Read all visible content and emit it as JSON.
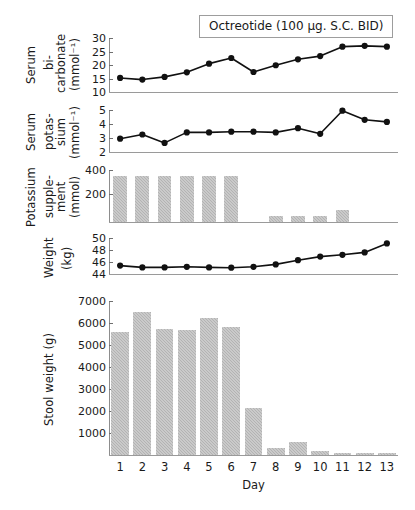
{
  "annotation": {
    "treatment_label": "Octreotide (100 µg. S.C. BID)"
  },
  "axis": {
    "x_title": "Day",
    "days": [
      "1",
      "2",
      "3",
      "4",
      "5",
      "6",
      "7",
      "8",
      "9",
      "10",
      "11",
      "12",
      "13"
    ]
  },
  "panels": {
    "bicarbonate": {
      "label_lines": [
        "Serum",
        "bi-\ncarbonate",
        "(mmol⁻¹)"
      ],
      "ticks": [
        "30",
        "25",
        "20",
        "15",
        "10"
      ]
    },
    "potassium": {
      "label_lines": [
        "Serum",
        "potas-\nsium",
        "(mmol⁻¹)"
      ],
      "ticks": [
        "5",
        "4",
        "3",
        "2"
      ]
    },
    "supplement": {
      "label_lines": [
        "Potassium",
        "supple-\nment",
        "(mmol)"
      ],
      "ticks": [
        "400",
        "200"
      ]
    },
    "weight": {
      "label_lines": [
        "Weight",
        "(kg)"
      ],
      "ticks": [
        "50",
        "48",
        "46",
        "44"
      ]
    },
    "stool": {
      "label": "Stool weight (g)",
      "ticks": [
        "7000",
        "6000",
        "5000",
        "4000",
        "3000",
        "2000",
        "1000"
      ]
    }
  },
  "colors": {
    "bar_fill": "#b3b3b3",
    "line": "#111111",
    "marker": "#111111",
    "axis": "#8d8d8d"
  },
  "chart_data": [
    {
      "type": "line",
      "title": "Serum bicarbonate",
      "xlabel": "Day",
      "ylabel": "Serum bi-carbonate (mmol⁻¹)",
      "x": [
        1,
        2,
        3,
        4,
        5,
        6,
        7,
        8,
        9,
        10,
        11,
        12,
        13
      ],
      "values": [
        15.2,
        14.6,
        15.6,
        17.3,
        20.5,
        22.6,
        17.4,
        19.9,
        22.1,
        23.3,
        26.8,
        27.1,
        26.8
      ],
      "ylim": [
        10,
        30
      ],
      "yticks": [
        10,
        15,
        20,
        25,
        30
      ],
      "grid": false,
      "annotation": "Octreotide (100 µg. S.C. BID)"
    },
    {
      "type": "line",
      "title": "Serum potassium",
      "xlabel": "Day",
      "ylabel": "Serum potassium (mmol⁻¹)",
      "x": [
        1,
        2,
        3,
        4,
        5,
        6,
        7,
        8,
        9,
        10,
        11,
        12,
        13
      ],
      "values": [
        2.95,
        3.25,
        2.65,
        3.4,
        3.4,
        3.45,
        3.45,
        3.4,
        3.7,
        3.3,
        4.95,
        4.3,
        4.15
      ],
      "ylim": [
        2,
        5
      ],
      "yticks": [
        2,
        3,
        4,
        5
      ],
      "grid": false
    },
    {
      "type": "bar",
      "title": "Potassium supplement",
      "xlabel": "Day",
      "ylabel": "Potassium supplement (mmol)",
      "categories": [
        "1",
        "2",
        "3",
        "4",
        "5",
        "6",
        "7",
        "8",
        "9",
        "10",
        "11",
        "12",
        "13"
      ],
      "values": [
        370,
        370,
        370,
        370,
        370,
        370,
        0,
        50,
        48,
        45,
        100,
        0,
        0
      ],
      "ylim": [
        0,
        420
      ],
      "yticks": [
        200,
        400
      ],
      "grid": false
    },
    {
      "type": "line",
      "title": "Weight",
      "xlabel": "Day",
      "ylabel": "Weight (kg)",
      "x": [
        1,
        2,
        3,
        4,
        5,
        6,
        7,
        8,
        9,
        10,
        11,
        12,
        13
      ],
      "values": [
        45.4,
        45.1,
        45.1,
        45.2,
        45.1,
        45.05,
        45.2,
        45.6,
        46.3,
        46.9,
        47.2,
        47.6,
        49.1,
        49.4
      ],
      "ylim": [
        44,
        50
      ],
      "yticks": [
        44,
        46,
        48,
        50
      ],
      "grid": false
    },
    {
      "type": "bar",
      "title": "Stool weight",
      "xlabel": "Day",
      "ylabel": "Stool weight (g)",
      "categories": [
        "1",
        "2",
        "3",
        "4",
        "5",
        "6",
        "7",
        "8",
        "9",
        "10",
        "11",
        "12",
        "13"
      ],
      "values": [
        5600,
        6500,
        5750,
        5700,
        6250,
        5800,
        2150,
        300,
        580,
        200,
        110,
        110,
        80
      ],
      "ylim": [
        0,
        7000
      ],
      "yticks": [
        1000,
        2000,
        3000,
        4000,
        5000,
        6000,
        7000
      ],
      "grid": false
    }
  ]
}
